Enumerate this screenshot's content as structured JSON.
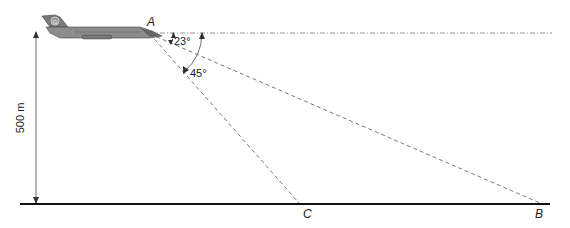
{
  "diagram": {
    "points": {
      "A": {
        "label": "A"
      },
      "B": {
        "label": "B"
      },
      "C": {
        "label": "C"
      }
    },
    "angles": {
      "to_B": "23°",
      "to_C": "45°"
    },
    "height_label": "500 m",
    "aircraft": {
      "tail_letter": "G"
    },
    "colors": {
      "line": "#333333",
      "dashed": "#555555",
      "ground": "#111111",
      "aircraft_body": "#8c8c8c",
      "aircraft_dark": "#555555"
    }
  }
}
